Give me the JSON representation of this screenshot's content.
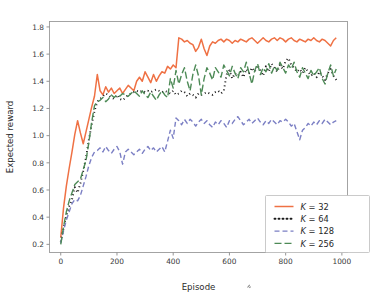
{
  "chart_data": {
    "type": "line",
    "title": "",
    "xlabel": "Episode",
    "ylabel": "Expected reward",
    "xlim": [
      -40,
      1020
    ],
    "ylim": [
      0.14,
      1.84
    ],
    "xticks": [
      0,
      200,
      400,
      600,
      800,
      1000
    ],
    "xtick_labels": [
      "0",
      "200",
      "400",
      "600",
      "800",
      "1000"
    ],
    "yticks": [
      0.2,
      0.4,
      0.6,
      0.8,
      1.0,
      1.2,
      1.4,
      1.6,
      1.8
    ],
    "ytick_labels": [
      "0.2",
      "0.4",
      "0.6",
      "0.8",
      "1.0",
      "1.2",
      "1.4",
      "1.6",
      "1.8"
    ],
    "grid": false,
    "legend_position": "lower right",
    "series": [
      {
        "name": "K = 32",
        "legend_label": "K = 32",
        "color": "#ef7144",
        "dash": "none",
        "width": 1.5,
        "x": [
          0,
          10,
          20,
          30,
          40,
          50,
          60,
          70,
          80,
          90,
          100,
          110,
          120,
          130,
          140,
          150,
          160,
          170,
          180,
          190,
          200,
          210,
          220,
          230,
          240,
          250,
          260,
          270,
          280,
          290,
          300,
          310,
          320,
          330,
          340,
          350,
          360,
          370,
          380,
          390,
          400,
          410,
          420,
          430,
          440,
          450,
          460,
          470,
          480,
          490,
          500,
          510,
          520,
          530,
          540,
          550,
          560,
          570,
          580,
          590,
          600,
          610,
          620,
          630,
          640,
          650,
          660,
          670,
          680,
          690,
          700,
          710,
          720,
          730,
          740,
          750,
          760,
          770,
          780,
          790,
          800,
          810,
          820,
          830,
          840,
          850,
          860,
          870,
          880,
          890,
          900,
          910,
          920,
          930,
          940,
          950,
          960,
          970,
          980
        ],
        "values": [
          0.25,
          0.47,
          0.63,
          0.76,
          0.88,
          1.01,
          1.11,
          1.02,
          0.94,
          1.03,
          1.12,
          1.21,
          1.29,
          1.45,
          1.33,
          1.3,
          1.36,
          1.32,
          1.35,
          1.31,
          1.33,
          1.35,
          1.31,
          1.34,
          1.37,
          1.35,
          1.33,
          1.4,
          1.43,
          1.4,
          1.47,
          1.43,
          1.39,
          1.45,
          1.4,
          1.44,
          1.47,
          1.46,
          1.51,
          1.49,
          1.52,
          1.5,
          1.72,
          1.71,
          1.69,
          1.7,
          1.68,
          1.67,
          1.62,
          1.65,
          1.71,
          1.64,
          1.59,
          1.66,
          1.69,
          1.68,
          1.7,
          1.71,
          1.69,
          1.71,
          1.7,
          1.68,
          1.7,
          1.69,
          1.71,
          1.7,
          1.69,
          1.71,
          1.72,
          1.7,
          1.68,
          1.7,
          1.72,
          1.7,
          1.69,
          1.71,
          1.72,
          1.7,
          1.72,
          1.71,
          1.69,
          1.71,
          1.72,
          1.7,
          1.69,
          1.71,
          1.7,
          1.69,
          1.71,
          1.7,
          1.72,
          1.7,
          1.69,
          1.71,
          1.7,
          1.68,
          1.66,
          1.7,
          1.72
        ]
      },
      {
        "name": "K = 64",
        "legend_label": "K = 64",
        "color": "#1a1a1a",
        "dash": "1,3",
        "width": 1.9,
        "x": [
          0,
          10,
          20,
          30,
          40,
          50,
          60,
          70,
          80,
          90,
          100,
          110,
          120,
          130,
          140,
          150,
          160,
          170,
          180,
          190,
          200,
          210,
          220,
          230,
          240,
          250,
          260,
          270,
          280,
          290,
          300,
          310,
          320,
          330,
          340,
          350,
          360,
          370,
          380,
          390,
          400,
          410,
          420,
          430,
          440,
          450,
          460,
          470,
          480,
          490,
          500,
          510,
          520,
          530,
          540,
          550,
          560,
          570,
          580,
          590,
          600,
          610,
          620,
          630,
          640,
          650,
          660,
          670,
          680,
          690,
          700,
          710,
          720,
          730,
          740,
          750,
          760,
          770,
          780,
          790,
          800,
          810,
          820,
          830,
          840,
          850,
          860,
          870,
          880,
          890,
          900,
          910,
          920,
          930,
          940,
          950,
          960,
          970,
          980
        ],
        "values": [
          0.22,
          0.32,
          0.41,
          0.48,
          0.53,
          0.62,
          0.58,
          0.65,
          0.74,
          0.84,
          0.97,
          1.08,
          1.18,
          1.25,
          1.27,
          1.29,
          1.31,
          1.3,
          1.28,
          1.27,
          1.3,
          1.27,
          1.26,
          1.28,
          1.3,
          1.31,
          1.32,
          1.33,
          1.32,
          1.33,
          1.32,
          1.33,
          1.32,
          1.33,
          1.34,
          1.33,
          1.32,
          1.33,
          1.32,
          1.31,
          1.33,
          1.3,
          1.31,
          1.33,
          1.32,
          1.29,
          1.31,
          1.3,
          1.28,
          1.31,
          1.3,
          1.31,
          1.32,
          1.31,
          1.3,
          1.32,
          1.33,
          1.31,
          1.33,
          1.45,
          1.48,
          1.42,
          1.46,
          1.44,
          1.47,
          1.43,
          1.49,
          1.46,
          1.5,
          1.47,
          1.52,
          1.48,
          1.44,
          1.51,
          1.47,
          1.53,
          1.5,
          1.47,
          1.52,
          1.49,
          1.55,
          1.57,
          1.52,
          1.5,
          1.47,
          1.49,
          1.46,
          1.5,
          1.47,
          1.44,
          1.46,
          1.43,
          1.47,
          1.44,
          1.41,
          1.46,
          1.49,
          1.44,
          1.41
        ]
      },
      {
        "name": "K = 128",
        "legend_label": "K = 128",
        "color": "#7b7fc4",
        "dash": "5,3",
        "width": 1.4,
        "x": [
          0,
          10,
          20,
          30,
          40,
          50,
          60,
          70,
          80,
          90,
          100,
          110,
          120,
          130,
          140,
          150,
          160,
          170,
          180,
          190,
          200,
          210,
          220,
          230,
          240,
          250,
          260,
          270,
          280,
          290,
          300,
          310,
          320,
          330,
          340,
          350,
          360,
          370,
          380,
          390,
          400,
          410,
          420,
          430,
          440,
          450,
          460,
          470,
          480,
          490,
          500,
          510,
          520,
          530,
          540,
          550,
          560,
          570,
          580,
          590,
          600,
          610,
          620,
          630,
          640,
          650,
          660,
          670,
          680,
          690,
          700,
          710,
          720,
          730,
          740,
          750,
          760,
          770,
          780,
          790,
          800,
          810,
          820,
          830,
          840,
          850,
          860,
          870,
          880,
          890,
          900,
          910,
          920,
          930,
          940,
          950,
          960,
          970,
          980
        ],
        "values": [
          0.21,
          0.3,
          0.38,
          0.44,
          0.5,
          0.53,
          0.52,
          0.56,
          0.63,
          0.7,
          0.78,
          0.84,
          0.88,
          0.89,
          0.91,
          0.88,
          0.92,
          0.89,
          0.87,
          0.9,
          0.92,
          0.88,
          0.79,
          0.88,
          0.9,
          0.88,
          0.86,
          0.88,
          0.9,
          0.87,
          0.9,
          0.92,
          0.89,
          0.91,
          0.88,
          0.9,
          0.92,
          0.88,
          0.96,
          1.04,
          0.98,
          1.13,
          1.11,
          1.08,
          1.12,
          1.09,
          1.12,
          1.1,
          1.07,
          1.1,
          1.12,
          1.09,
          1.11,
          1.08,
          1.06,
          1.1,
          1.08,
          1.11,
          1.09,
          1.06,
          1.11,
          1.09,
          1.12,
          1.14,
          1.11,
          1.08,
          1.1,
          1.12,
          1.09,
          1.11,
          1.13,
          1.1,
          1.08,
          1.11,
          1.09,
          1.12,
          1.1,
          1.08,
          1.11,
          1.1,
          1.12,
          1.1,
          1.07,
          1.09,
          1.03,
          0.97,
          1.04,
          1.06,
          1.09,
          1.07,
          1.1,
          1.08,
          1.11,
          1.09,
          1.12,
          1.1,
          1.08,
          1.1,
          1.11
        ]
      },
      {
        "name": "K = 256",
        "legend_label": "K = 256",
        "color": "#4d8a56",
        "dash": "7,3",
        "width": 1.4,
        "x": [
          0,
          10,
          20,
          30,
          40,
          50,
          60,
          70,
          80,
          90,
          100,
          110,
          120,
          130,
          140,
          150,
          160,
          170,
          180,
          190,
          200,
          210,
          220,
          230,
          240,
          250,
          260,
          270,
          280,
          290,
          300,
          310,
          320,
          330,
          340,
          350,
          360,
          370,
          380,
          390,
          400,
          410,
          420,
          430,
          440,
          450,
          460,
          470,
          480,
          490,
          500,
          510,
          520,
          530,
          540,
          550,
          560,
          570,
          580,
          590,
          600,
          610,
          620,
          630,
          640,
          650,
          660,
          670,
          680,
          690,
          700,
          710,
          720,
          730,
          740,
          750,
          760,
          770,
          780,
          790,
          800,
          810,
          820,
          830,
          840,
          850,
          860,
          870,
          880,
          890,
          900,
          910,
          920,
          930,
          940,
          950,
          960,
          970,
          980
        ],
        "values": [
          0.2,
          0.33,
          0.44,
          0.52,
          0.58,
          0.64,
          0.66,
          0.68,
          0.75,
          0.82,
          0.95,
          1.1,
          1.22,
          1.25,
          1.26,
          1.28,
          1.25,
          1.27,
          1.3,
          1.28,
          1.3,
          1.29,
          1.31,
          1.3,
          1.29,
          1.31,
          1.33,
          1.31,
          1.29,
          1.33,
          1.3,
          1.28,
          1.32,
          1.29,
          1.26,
          1.3,
          1.33,
          1.3,
          1.28,
          1.42,
          1.35,
          1.48,
          1.38,
          1.45,
          1.5,
          1.4,
          1.33,
          1.45,
          1.52,
          1.44,
          1.3,
          1.42,
          1.5,
          1.46,
          1.41,
          1.5,
          1.47,
          1.43,
          1.52,
          1.48,
          1.44,
          1.51,
          1.46,
          1.42,
          1.5,
          1.47,
          1.54,
          1.46,
          1.38,
          1.48,
          1.53,
          1.45,
          1.5,
          1.47,
          1.53,
          1.46,
          1.51,
          1.48,
          1.54,
          1.5,
          1.46,
          1.52,
          1.49,
          1.54,
          1.47,
          1.43,
          1.5,
          1.46,
          1.42,
          1.48,
          1.44,
          1.47,
          1.5,
          1.42,
          1.38,
          1.46,
          1.52,
          1.44,
          1.49
        ]
      }
    ]
  }
}
